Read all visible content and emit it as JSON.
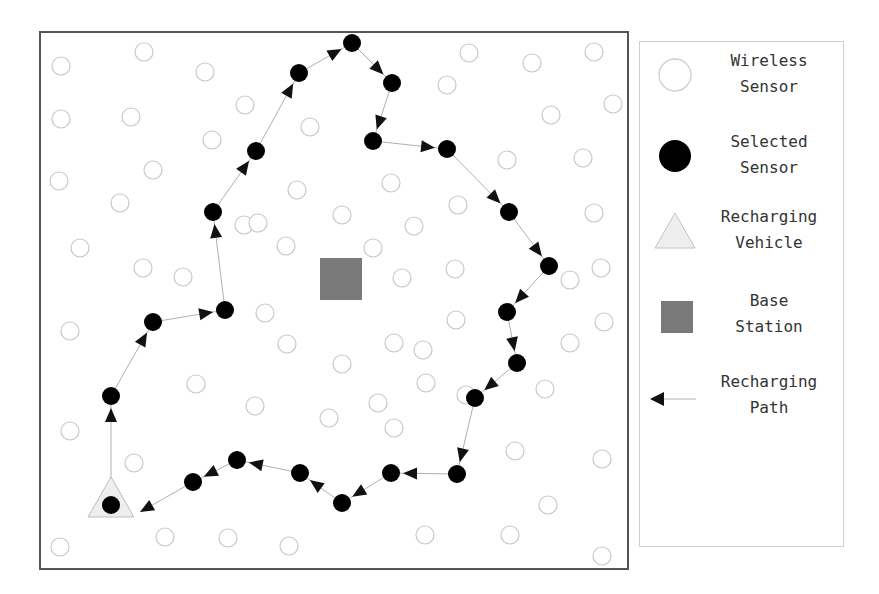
{
  "figure": {
    "title": "",
    "plot_area": {
      "x": 40,
      "y": 32,
      "width": 588,
      "height": 537,
      "border_color": "#555555"
    },
    "colors": {
      "wireless_sensor_stroke": "#c8c8c8",
      "selected_sensor_fill": "#000000",
      "vehicle_fill": "#eeeeee",
      "vehicle_stroke": "#bdbdbd",
      "base_station_fill": "#7a7a7a",
      "path_line": "#b0b0b0",
      "arrow_fill": "#111111"
    }
  },
  "legend": {
    "items": [
      {
        "key": "wireless_sensor",
        "label": "Wireless\nSensor",
        "icon": "hollow-circle"
      },
      {
        "key": "selected_sensor",
        "label": "Selected\nSensor",
        "icon": "filled-circle"
      },
      {
        "key": "recharging_vehicle",
        "label": "Recharging\nVehicle",
        "icon": "triangle"
      },
      {
        "key": "base_station",
        "label": "Base\nStation",
        "icon": "square"
      },
      {
        "key": "recharging_path",
        "label": "Recharging\nPath",
        "icon": "arrow-left"
      }
    ]
  },
  "base_station": {
    "x": 341,
    "y": 279,
    "size": 42
  },
  "recharging_vehicle": {
    "x": 111,
    "y": 497,
    "base": 46,
    "height": 42
  },
  "wireless_sensors": [
    [
      61,
      66
    ],
    [
      144,
      52
    ],
    [
      205,
      72
    ],
    [
      245,
      105
    ],
    [
      61,
      119
    ],
    [
      131,
      117
    ],
    [
      212,
      140
    ],
    [
      310,
      127
    ],
    [
      59,
      181
    ],
    [
      153,
      170
    ],
    [
      297,
      190
    ],
    [
      244,
      225
    ],
    [
      120,
      203
    ],
    [
      80,
      248
    ],
    [
      143,
      268
    ],
    [
      183,
      277
    ],
    [
      258,
      223
    ],
    [
      286,
      246
    ],
    [
      342,
      215
    ],
    [
      391,
      183
    ],
    [
      414,
      226
    ],
    [
      373,
      248
    ],
    [
      402,
      278
    ],
    [
      455,
      269
    ],
    [
      469,
      53
    ],
    [
      532,
      63
    ],
    [
      594,
      52
    ],
    [
      613,
      104
    ],
    [
      551,
      115
    ],
    [
      447,
      85
    ],
    [
      507,
      160
    ],
    [
      583,
      158
    ],
    [
      458,
      205
    ],
    [
      594,
      213
    ],
    [
      601,
      268
    ],
    [
      570,
      280
    ],
    [
      604,
      322
    ],
    [
      570,
      343
    ],
    [
      456,
      320
    ],
    [
      423,
      350
    ],
    [
      394,
      343
    ],
    [
      287,
      344
    ],
    [
      342,
      364
    ],
    [
      265,
      313
    ],
    [
      70,
      331
    ],
    [
      196,
      384
    ],
    [
      255,
      406
    ],
    [
      329,
      418
    ],
    [
      378,
      403
    ],
    [
      426,
      383
    ],
    [
      515,
      451
    ],
    [
      545,
      389
    ],
    [
      602,
      459
    ],
    [
      548,
      505
    ],
    [
      510,
      535
    ],
    [
      602,
      556
    ],
    [
      466,
      395
    ],
    [
      394,
      428
    ],
    [
      70,
      431
    ],
    [
      134,
      463
    ],
    [
      60,
      547
    ],
    [
      165,
      537
    ],
    [
      228,
      538
    ],
    [
      289,
      546
    ],
    [
      425,
      535
    ]
  ],
  "selected_sensors": [
    [
      111,
      505
    ],
    [
      111,
      396
    ],
    [
      153,
      322
    ],
    [
      225,
      310
    ],
    [
      213,
      212
    ],
    [
      256,
      151
    ],
    [
      299,
      73
    ],
    [
      352,
      43
    ],
    [
      392,
      83
    ],
    [
      373,
      141
    ],
    [
      447,
      149
    ],
    [
      509,
      212
    ],
    [
      549,
      266
    ],
    [
      507,
      312
    ],
    [
      517,
      363
    ],
    [
      475,
      398
    ],
    [
      457,
      474
    ],
    [
      391,
      473
    ],
    [
      342,
      503
    ],
    [
      300,
      473
    ],
    [
      237,
      460
    ],
    [
      193,
      482
    ]
  ],
  "path_order_note": "closed tour starting and ending at recharging vehicle",
  "path": [
    [
      111,
      505
    ],
    [
      111,
      396
    ],
    [
      153,
      322
    ],
    [
      225,
      310
    ],
    [
      213,
      212
    ],
    [
      256,
      151
    ],
    [
      299,
      73
    ],
    [
      352,
      43
    ],
    [
      392,
      83
    ],
    [
      373,
      141
    ],
    [
      447,
      149
    ],
    [
      509,
      212
    ],
    [
      549,
      266
    ],
    [
      507,
      312
    ],
    [
      517,
      363
    ],
    [
      475,
      398
    ],
    [
      457,
      474
    ],
    [
      391,
      473
    ],
    [
      342,
      503
    ],
    [
      300,
      473
    ],
    [
      237,
      460
    ],
    [
      193,
      482
    ],
    [
      140,
      512
    ]
  ]
}
